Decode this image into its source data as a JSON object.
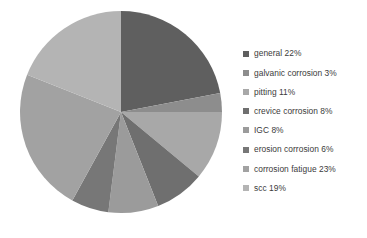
{
  "chart_data": {
    "type": "pie",
    "title": "",
    "labels": [
      "general",
      "galvanic corrosion",
      "pitting",
      "crevice corrosion",
      "IGC",
      "erosion corrosion",
      "corrosion fatigue",
      "scc"
    ],
    "values": [
      22,
      3,
      11,
      8,
      8,
      6,
      23,
      19
    ],
    "value_unit": "%",
    "start_angle_deg": 0,
    "direction": "clockwise",
    "legend_position": "right",
    "grid": false,
    "colors": [
      "#5f5f5f",
      "#8d8d8d",
      "#a8a8a8",
      "#6f6f6f",
      "#9b9b9b",
      "#777777",
      "#a2a2a2",
      "#b4b4b4"
    ],
    "slices": [
      {
        "label": "general",
        "value": 22,
        "color": "#5f5f5f",
        "legend_text": "general 22%"
      },
      {
        "label": "galvanic corrosion",
        "value": 3,
        "color": "#8d8d8d",
        "legend_text": "galvanic corrosion 3%"
      },
      {
        "label": "pitting",
        "value": 11,
        "color": "#a8a8a8",
        "legend_text": "pitting 11%"
      },
      {
        "label": "crevice corrosion",
        "value": 8,
        "color": "#6f6f6f",
        "legend_text": "crevice corrosion 8%"
      },
      {
        "label": "IGC",
        "value": 8,
        "color": "#9b9b9b",
        "legend_text": "IGC 8%"
      },
      {
        "label": "erosion corrosion",
        "value": 6,
        "color": "#777777",
        "legend_text": "erosion corrosion 6%"
      },
      {
        "label": "corrosion fatigue",
        "value": 23,
        "color": "#a2a2a2",
        "legend_text": "corrosion fatigue 23%"
      },
      {
        "label": "scc",
        "value": 19,
        "color": "#b4b4b4",
        "legend_text": "scc 19%"
      }
    ]
  },
  "geometry": {
    "center_x": 121,
    "center_y": 112,
    "radius": 101
  }
}
